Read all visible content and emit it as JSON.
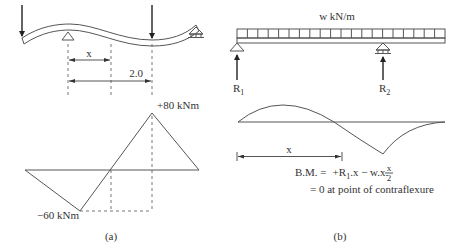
{
  "figure_a": {
    "caption": "(a)",
    "beam": {
      "loads": [
        "point-load-left-overhang",
        "point-load-span"
      ],
      "supports": [
        "pinned-support",
        "roller-support"
      ]
    },
    "dimensions": {
      "x_label": "x",
      "distance_label": "2.0"
    },
    "bending_moment": {
      "max_positive_label": "+80 kNm",
      "max_negative_label": "−60 kNm"
    }
  },
  "figure_b": {
    "caption": "(b)",
    "load_label": "w kN/m",
    "reactions": {
      "left": {
        "symbol": "R",
        "subscript": "1"
      },
      "right": {
        "symbol": "R",
        "subscript": "2"
      }
    },
    "dimension_label": "x",
    "equation": {
      "lhs": "B.M. =",
      "rhs_part1": "+R",
      "rhs_sub": "1",
      "rhs_part2": ".x − w.x.",
      "frac_num": "x",
      "frac_den": "2",
      "line2": "= 0 at point of contraflexure"
    }
  },
  "colors": {
    "line": "#555555",
    "text": "#333333",
    "arrow": "#222222",
    "background": "#ffffff"
  }
}
